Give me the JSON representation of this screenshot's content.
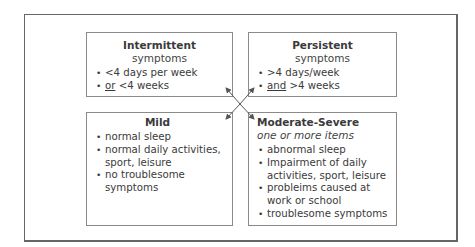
{
  "diagram": {
    "type": "quadrant-classification",
    "boxes": {
      "intermittent": {
        "title": "Intermittent",
        "subtitle": "symptoms",
        "items": [
          {
            "emphasis": "",
            "text": "<4 days per week"
          },
          {
            "emphasis": "or",
            "text": " <4 weeks"
          }
        ]
      },
      "persistent": {
        "title": "Persistent",
        "subtitle": "symptoms",
        "items": [
          {
            "emphasis": "",
            "text": ">4 days/week"
          },
          {
            "emphasis": "and",
            "text": " >4 weeks"
          }
        ]
      },
      "mild": {
        "title": "Mild",
        "items": [
          "normal sleep",
          "normal daily activities, sport, leisure",
          "no troublesome symptoms"
        ]
      },
      "moderate_severe": {
        "title": "Moderate-Severe",
        "subtitle": "one or more items",
        "items": [
          "abnormal sleep",
          "Impairment of daily activities, sport, leisure",
          "probleims caused at work or school",
          "troublesome symptoms"
        ]
      }
    },
    "connectors": "crossed double-headed arrows linking all four boxes",
    "colors": {
      "frame": "#666666",
      "box_border": "#8a8a8a",
      "text": "#3a3a3a",
      "arrow": "#555555"
    }
  }
}
